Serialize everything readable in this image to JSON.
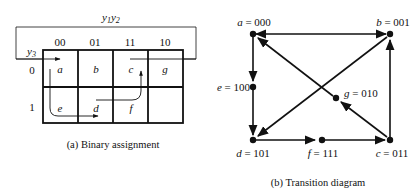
{
  "kmap": {
    "column_var_label": "y1y2",
    "row_var_label": "y3",
    "columns": [
      "00",
      "01",
      "11",
      "10"
    ],
    "rows": [
      "0",
      "1"
    ],
    "cells": [
      [
        "a",
        "b",
        "c",
        "g"
      ],
      [
        "e",
        "d",
        "f",
        ""
      ]
    ],
    "caption": "(a)  Binary assignment"
  },
  "transition_diagram": {
    "nodes": [
      {
        "id": "a",
        "label": "a = 000"
      },
      {
        "id": "b",
        "label": "b = 001"
      },
      {
        "id": "c",
        "label": "c = 011"
      },
      {
        "id": "d",
        "label": "d = 101"
      },
      {
        "id": "e",
        "label": "e = 100"
      },
      {
        "id": "f",
        "label": "f = 111"
      },
      {
        "id": "g",
        "label": "g = 010"
      }
    ],
    "edges": [
      {
        "from": "b",
        "to": "a"
      },
      {
        "from": "a",
        "to": "b"
      },
      {
        "from": "a",
        "to": "e"
      },
      {
        "from": "e",
        "to": "d"
      },
      {
        "from": "d",
        "to": "f"
      },
      {
        "from": "f",
        "to": "c"
      },
      {
        "from": "c",
        "to": "b"
      },
      {
        "from": "b",
        "to": "d"
      },
      {
        "from": "c",
        "to": "g"
      },
      {
        "from": "g",
        "to": "a"
      }
    ],
    "caption": "(b)  Transition diagram"
  }
}
